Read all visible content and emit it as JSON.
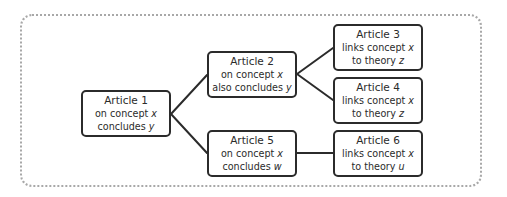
{
  "diagram": {
    "type": "tree",
    "frame_style": "dotted-rounded",
    "colors": {
      "stroke": "#2b2b2b",
      "frame": "#a8a8a8",
      "background": "#ffffff"
    },
    "nodes": [
      {
        "id": "article-1",
        "title": "Article 1",
        "line1_prefix": "on concept ",
        "line1_var": "x",
        "line2_prefix": "concludes ",
        "line2_var": "y"
      },
      {
        "id": "article-2",
        "title": "Article 2",
        "line1_prefix": "on concept ",
        "line1_var": "x",
        "line2_prefix": "also concludes ",
        "line2_var": "y"
      },
      {
        "id": "article-3",
        "title": "Article 3",
        "line1_prefix": "links concept ",
        "line1_var": "x",
        "line2_prefix": "to theory ",
        "line2_var": "z"
      },
      {
        "id": "article-4",
        "title": "Article 4",
        "line1_prefix": "links concept ",
        "line1_var": "x",
        "line2_prefix": "to theory ",
        "line2_var": "z"
      },
      {
        "id": "article-5",
        "title": "Article 5",
        "line1_prefix": "on concept ",
        "line1_var": "x",
        "line2_prefix": "concludes ",
        "line2_var": "w"
      },
      {
        "id": "article-6",
        "title": "Article 6",
        "line1_prefix": "links concept ",
        "line1_var": "x",
        "line2_prefix": "to theory ",
        "line2_var": "u"
      }
    ],
    "edges": [
      {
        "from": "article-1",
        "to": "article-2"
      },
      {
        "from": "article-1",
        "to": "article-5"
      },
      {
        "from": "article-2",
        "to": "article-3"
      },
      {
        "from": "article-2",
        "to": "article-4"
      },
      {
        "from": "article-5",
        "to": "article-6"
      }
    ]
  }
}
